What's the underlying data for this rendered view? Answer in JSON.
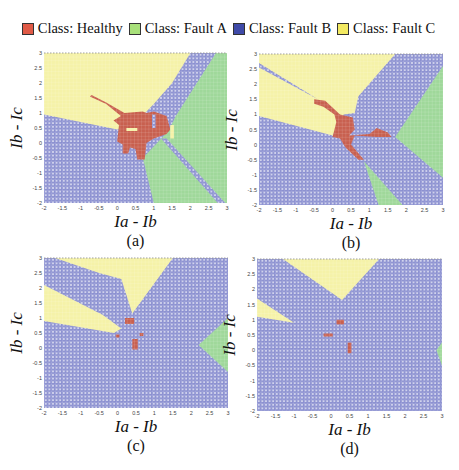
{
  "legend": {
    "items": [
      {
        "label": "Class: Healthy",
        "color": "#e05a46"
      },
      {
        "label": "Class: Fault A",
        "color": "#a8e07a"
      },
      {
        "label": "Class: Fault B",
        "color": "#3f4aa8"
      },
      {
        "label": "Class: Fault C",
        "color": "#f3ea62"
      }
    ]
  },
  "colors": {
    "healthy": "#c8604f",
    "faultA": "#9fd89a",
    "faultB": "#8a8fd0",
    "faultC": "#f5f2a8",
    "dot": "#ffffff"
  },
  "axes": {
    "xlabel": "Ia - Ib",
    "ylabel": "Ib - Ic",
    "xticks": [
      "-2",
      "-1.5",
      "-1",
      "-0.5",
      "0",
      "0.5",
      "1",
      "1.5",
      "2",
      "2.5",
      "3"
    ],
    "yticks": [
      "-2",
      "-1.5",
      "-1",
      "-0.5",
      "0",
      "0.5",
      "1",
      "1.5",
      "2",
      "2.5",
      "3"
    ],
    "xlim": [
      -2,
      3
    ],
    "ylim": [
      -2,
      3
    ]
  },
  "chart_data": [
    {
      "type": "heatmap",
      "panel": "(a)",
      "title": "(a)",
      "xlabel": "Ia - Ib",
      "ylabel": "Ib - Ic",
      "xlim": [
        -2,
        3
      ],
      "ylim": [
        -2,
        3
      ],
      "background_class": "Fault B",
      "regions": [
        {
          "class": "Fault C",
          "polygon": [
            [
              -2,
              3
            ],
            [
              2.0,
              3
            ],
            [
              1.5,
              2.0
            ],
            [
              1.0,
              1.3
            ],
            [
              0.6,
              0.8
            ],
            [
              0.0,
              0.45
            ],
            [
              -2,
              0.95
            ]
          ]
        },
        {
          "class": "Fault A",
          "polygon": [
            [
              0.7,
              -0.5
            ],
            [
              1.0,
              -2
            ],
            [
              3,
              -2
            ],
            [
              3,
              3
            ],
            [
              2.7,
              3
            ],
            [
              1.6,
              0.9
            ],
            [
              1.4,
              0.4
            ]
          ]
        },
        {
          "class": "Fault B",
          "polygon": [
            [
              1.2,
              0.15
            ],
            [
              1.35,
              0.15
            ],
            [
              2.95,
              -2
            ],
            [
              2.75,
              -2
            ]
          ]
        },
        {
          "class": "Healthy",
          "polygon": [
            [
              -0.7,
              1.6
            ],
            [
              -0.3,
              1.35
            ],
            [
              0.2,
              1.0
            ],
            [
              0.7,
              1.05
            ],
            [
              0.8,
              1.0
            ],
            [
              1.0,
              1.05
            ],
            [
              1.35,
              0.9
            ],
            [
              1.45,
              0.45
            ],
            [
              1.35,
              0.3
            ],
            [
              1.0,
              0.15
            ],
            [
              0.8,
              0.0
            ],
            [
              0.75,
              -0.55
            ],
            [
              0.55,
              -0.55
            ],
            [
              0.5,
              -0.2
            ],
            [
              0.35,
              -0.15
            ],
            [
              0.3,
              -0.35
            ],
            [
              0.15,
              -0.35
            ],
            [
              0.15,
              -0.05
            ],
            [
              0.0,
              0.05
            ],
            [
              0.05,
              0.6
            ],
            [
              -0.1,
              0.75
            ],
            [
              0.1,
              0.9
            ],
            [
              -0.3,
              1.3
            ],
            [
              -0.75,
              1.55
            ]
          ]
        },
        {
          "class": "Fault B",
          "polygon": [
            [
              0.95,
              0.95
            ],
            [
              1.05,
              0.95
            ],
            [
              1.05,
              0.5
            ],
            [
              0.95,
              0.5
            ]
          ]
        },
        {
          "class": "Fault C",
          "polygon": [
            [
              0.25,
              0.5
            ],
            [
              0.55,
              0.5
            ],
            [
              0.55,
              0.4
            ],
            [
              0.25,
              0.4
            ]
          ]
        },
        {
          "class": "Fault C",
          "polygon": [
            [
              1.45,
              0.15
            ],
            [
              1.55,
              0.15
            ],
            [
              1.55,
              0.6
            ],
            [
              1.45,
              0.6
            ]
          ]
        }
      ]
    },
    {
      "type": "heatmap",
      "panel": "(b)",
      "title": "(b)",
      "xlabel": "Ia - Ib",
      "ylabel": "Ib - Ic",
      "xlim": [
        -2,
        3
      ],
      "ylim": [
        -2,
        3
      ],
      "background_class": "Fault B",
      "regions": [
        {
          "class": "Fault C",
          "polygon": [
            [
              -2,
              3
            ],
            [
              1.7,
              3
            ],
            [
              0.7,
              1.6
            ],
            [
              0.6,
              1.05
            ],
            [
              0.3,
              1.0
            ],
            [
              0.0,
              0.3
            ],
            [
              -2,
              0.95
            ],
            [
              -2,
              2.55
            ],
            [
              -0.4,
              1.5
            ],
            [
              -2,
              2.7
            ]
          ]
        },
        {
          "class": "Fault A",
          "polygon": [
            [
              1.7,
              0.25
            ],
            [
              3,
              2.6
            ],
            [
              3,
              -1.1
            ]
          ]
        },
        {
          "class": "Fault A",
          "polygon": [
            [
              0.85,
              -0.55
            ],
            [
              1.25,
              -2
            ],
            [
              1.9,
              -2
            ]
          ]
        },
        {
          "class": "Healthy",
          "polygon": [
            [
              -0.5,
              1.5
            ],
            [
              -0.2,
              1.45
            ],
            [
              0.2,
              1.0
            ],
            [
              0.55,
              0.9
            ],
            [
              0.6,
              0.5
            ],
            [
              0.45,
              0.3
            ],
            [
              1.0,
              0.35
            ],
            [
              1.2,
              0.55
            ],
            [
              1.5,
              0.4
            ],
            [
              1.6,
              0.25
            ],
            [
              1.2,
              0.25
            ],
            [
              0.6,
              0.3
            ],
            [
              0.5,
              0.0
            ],
            [
              0.85,
              -0.5
            ],
            [
              0.7,
              -0.5
            ],
            [
              0.35,
              -0.1
            ],
            [
              0.2,
              0.2
            ],
            [
              0.0,
              0.25
            ],
            [
              0.1,
              0.75
            ],
            [
              0.05,
              1.0
            ],
            [
              -0.25,
              1.25
            ],
            [
              -0.5,
              1.35
            ]
          ]
        }
      ]
    },
    {
      "type": "heatmap",
      "panel": "(c)",
      "title": "(c)",
      "xlabel": "Ia - Ib",
      "ylabel": "Ib - Ic",
      "xlim": [
        -2,
        3
      ],
      "ylim": [
        -2,
        3
      ],
      "background_class": "Fault B",
      "regions": [
        {
          "class": "Fault C",
          "polygon": [
            [
              -1.7,
              3
            ],
            [
              1.5,
              3
            ],
            [
              0.4,
              1.15
            ],
            [
              0.1,
              2.3
            ],
            [
              -0.5,
              2.5
            ]
          ]
        },
        {
          "class": "Fault C",
          "polygon": [
            [
              -2,
              2.1
            ],
            [
              -0.4,
              1.1
            ],
            [
              0.1,
              0.65
            ],
            [
              -0.1,
              0.5
            ],
            [
              -2,
              0.9
            ]
          ]
        },
        {
          "class": "Fault A",
          "polygon": [
            [
              2.2,
              0.1
            ],
            [
              3,
              1.0
            ],
            [
              3,
              -0.8
            ]
          ]
        },
        {
          "class": "Healthy",
          "polygon": [
            [
              0.2,
              1.0
            ],
            [
              0.45,
              1.0
            ],
            [
              0.45,
              0.8
            ],
            [
              0.2,
              0.8
            ]
          ]
        },
        {
          "class": "Healthy",
          "polygon": [
            [
              0.4,
              0.3
            ],
            [
              0.55,
              0.3
            ],
            [
              0.55,
              -0.05
            ],
            [
              0.4,
              -0.05
            ]
          ]
        },
        {
          "class": "Healthy",
          "polygon": [
            [
              -0.05,
              0.45
            ],
            [
              0.05,
              0.45
            ],
            [
              0.05,
              0.35
            ],
            [
              -0.05,
              0.35
            ]
          ]
        },
        {
          "class": "Healthy",
          "polygon": [
            [
              0.6,
              0.5
            ],
            [
              0.7,
              0.5
            ],
            [
              0.7,
              0.4
            ],
            [
              0.6,
              0.4
            ]
          ]
        }
      ]
    },
    {
      "type": "heatmap",
      "panel": "(d)",
      "title": "(d)",
      "xlabel": "Ia - Ib",
      "ylabel": "Ib - Ic",
      "xlim": [
        -2,
        3
      ],
      "ylim": [
        -2,
        3
      ],
      "background_class": "Fault B",
      "regions": [
        {
          "class": "Fault C",
          "polygon": [
            [
              -1.3,
              3
            ],
            [
              1.3,
              3
            ],
            [
              0.3,
              1.65
            ]
          ]
        },
        {
          "class": "Fault C",
          "polygon": [
            [
              -2,
              1.7
            ],
            [
              -1.0,
              0.9
            ],
            [
              -2,
              1.1
            ]
          ]
        },
        {
          "class": "Fault A",
          "polygon": [
            [
              2.85,
              0.0
            ],
            [
              3,
              0.25
            ],
            [
              3,
              -0.5
            ]
          ]
        },
        {
          "class": "Healthy",
          "polygon": [
            [
              0.15,
              1.0
            ],
            [
              0.35,
              1.0
            ],
            [
              0.35,
              0.85
            ],
            [
              0.15,
              0.85
            ]
          ]
        },
        {
          "class": "Healthy",
          "polygon": [
            [
              -0.2,
              0.55
            ],
            [
              0.05,
              0.55
            ],
            [
              0.05,
              0.45
            ],
            [
              -0.2,
              0.45
            ]
          ]
        },
        {
          "class": "Healthy",
          "polygon": [
            [
              0.45,
              0.25
            ],
            [
              0.55,
              0.25
            ],
            [
              0.55,
              -0.1
            ],
            [
              0.45,
              -0.1
            ]
          ]
        }
      ]
    }
  ],
  "panels": [
    {
      "id": "a",
      "caption": "(a)",
      "plot": {
        "x": 44,
        "y": 53,
        "w": 183,
        "h": 150
      }
    },
    {
      "id": "b",
      "caption": "(b)",
      "plot": {
        "x": 259,
        "y": 54,
        "w": 184,
        "h": 151
      }
    },
    {
      "id": "c",
      "caption": "(c)",
      "plot": {
        "x": 44,
        "y": 258,
        "w": 184,
        "h": 150
      }
    },
    {
      "id": "d",
      "caption": "(d)",
      "plot": {
        "x": 257,
        "y": 259,
        "w": 185,
        "h": 152
      }
    }
  ]
}
